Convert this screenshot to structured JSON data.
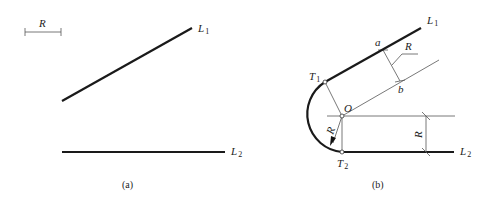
{
  "panel_a": {
    "caption": "(a)",
    "scale_bar_label": "R",
    "line1": {
      "name": "L",
      "subscript": "1"
    },
    "line2": {
      "name": "L",
      "subscript": "2"
    }
  },
  "panel_b": {
    "caption": "(b)",
    "line1": {
      "name": "L",
      "subscript": "1"
    },
    "line2": {
      "name": "L",
      "subscript": "2"
    },
    "tangent1": {
      "name": "T",
      "subscript": "1"
    },
    "tangent2": {
      "name": "T",
      "subscript": "2"
    },
    "center_label": "O",
    "point_a": "a",
    "point_b": "b",
    "radius_label_ab": "R",
    "radius_label_arrow": "R",
    "radius_label_dim": "R"
  }
}
